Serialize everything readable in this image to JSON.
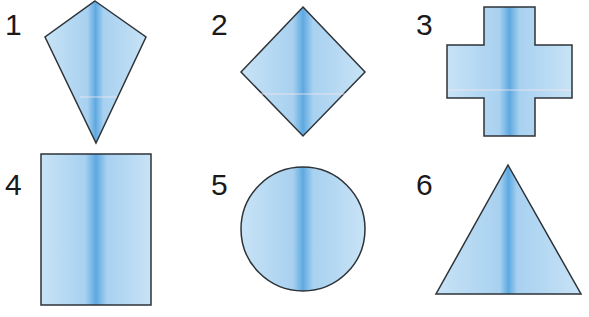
{
  "colors": {
    "fill_light": "#c4e0f5",
    "fill_mid": "#a9d2f0",
    "fill_dark": "#5aa7e0",
    "stroke": "#2e3338"
  },
  "shapes": [
    {
      "label": "1",
      "name": "kite"
    },
    {
      "label": "2",
      "name": "square-rotated"
    },
    {
      "label": "3",
      "name": "cross"
    },
    {
      "label": "4",
      "name": "rectangle"
    },
    {
      "label": "5",
      "name": "circle"
    },
    {
      "label": "6",
      "name": "triangle"
    }
  ]
}
